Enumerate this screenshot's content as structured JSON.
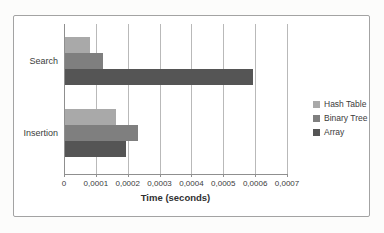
{
  "chart_data": {
    "type": "bar",
    "orientation": "horizontal",
    "title": "",
    "xlabel": "Time (seconds)",
    "ylabel": "",
    "categories": [
      "Search",
      "Insertion"
    ],
    "series": [
      {
        "name": "Hash Table",
        "color": "#a9a9a9",
        "values": [
          8e-05,
          0.00016
        ]
      },
      {
        "name": "Binary Tree",
        "color": "#7f7f7f",
        "values": [
          0.00012,
          0.00023
        ]
      },
      {
        "name": "Array",
        "color": "#555555",
        "values": [
          0.00059,
          0.00019
        ]
      }
    ],
    "xlim": [
      0,
      0.0007
    ],
    "xticks": [
      0,
      0.0001,
      0.0002,
      0.0003,
      0.0004,
      0.0005,
      0.0006,
      0.0007
    ],
    "xtick_labels": [
      "0",
      "0,0001",
      "0,0002",
      "0,0003",
      "0,0004",
      "0,0005",
      "0,0006",
      "0,0007"
    ],
    "grid": true,
    "legend_position": "right",
    "decimal_separator": ","
  },
  "colors": {
    "background": "#ffffff",
    "frame_border": "#a3a3a3",
    "gridline": "#b9b9b9",
    "axis": "#8f8f8f",
    "text": "#3b3b3b"
  }
}
